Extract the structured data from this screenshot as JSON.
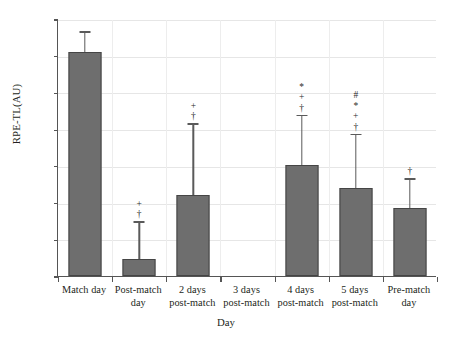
{
  "chart_data": {
    "type": "bar",
    "title": "",
    "xlabel": "Day",
    "ylabel": "RPE-TL(AU)",
    "ylim": [
      0,
      700
    ],
    "ytick_step": 100,
    "yticks": [
      0,
      100,
      200,
      300,
      400,
      500,
      600,
      700
    ],
    "grid": true,
    "legend": null,
    "categories": [
      "Match day",
      "Post-match day",
      "2 days post-match",
      "3 days post-match",
      "4 days post-match",
      "5 days post-match",
      "Pre-match day"
    ],
    "category_lines": [
      [
        "Match day"
      ],
      [
        "Post-match",
        "day"
      ],
      [
        "2 days",
        "post-match"
      ],
      [
        "3 days",
        "post-match"
      ],
      [
        "4 days",
        "post-match"
      ],
      [
        "5 days",
        "post-match"
      ],
      [
        "Pre-match",
        "day"
      ]
    ],
    "values": [
      610,
      47,
      222,
      null,
      303,
      240,
      185
    ],
    "error_upper": [
      663,
      145,
      412,
      null,
      435,
      384,
      262
    ],
    "annotations": [
      [],
      [
        "+",
        "†"
      ],
      [
        "+",
        "†"
      ],
      [],
      [
        "*",
        "+",
        "†"
      ],
      [
        "#",
        "*",
        "+",
        "†"
      ],
      [
        "†"
      ]
    ],
    "bar_color": "#6e6e6e",
    "bar_edge_color": "#454545",
    "error_color": "#5a5a5a",
    "grid_color": "#e6e6e6",
    "axis_color": "#555555",
    "background": "#ffffff"
  }
}
